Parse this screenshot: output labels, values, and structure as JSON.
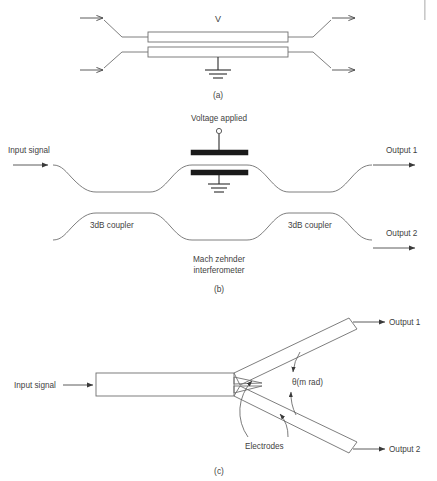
{
  "figure": {
    "background_color": "#ffffff",
    "line_color": "#6f6f6f",
    "electrode_color": "#1a1a1a",
    "text_color": "#3f3f3f"
  },
  "panel_a": {
    "caption": "(a)",
    "voltage_label": "V",
    "description": "Directional coupler modulator with two parallel waveguides",
    "icons": {
      "ground": "ground-icon",
      "input_arrow_top": "arrow-right-icon",
      "input_arrow_bottom": "arrow-right-icon",
      "output_arrow_top": "arrow-right-icon",
      "output_arrow_bottom": "arrow-right-icon"
    }
  },
  "panel_b": {
    "caption": "(b)",
    "voltage_label": "Voltage applied",
    "input_label": "Input signal",
    "output_1_label": "Output 1",
    "output_2_label": "Output 2",
    "coupler_left_label": "3dB coupler",
    "coupler_right_label": "3dB coupler",
    "interferometer_label_line1": "Mach zehnder",
    "interferometer_label_line2": "interferometer",
    "icons": {
      "terminal": "terminal-circle-icon",
      "ground": "ground-icon",
      "electrode_top": "electrode-bar-icon",
      "electrode_bottom": "electrode-bar-icon",
      "input_arrow": "arrow-right-icon",
      "output_1_arrow": "arrow-right-icon",
      "output_2_arrow": "arrow-right-icon"
    }
  },
  "panel_c": {
    "caption": "(c)",
    "input_label": "Input signal",
    "output_1_label": "Output 1",
    "output_2_label": "Output 2",
    "angle_label": "θ(m rad)",
    "electrodes_label": "Electrodes",
    "icons": {
      "input_arrow": "arrow-right-icon",
      "output_1_arrow": "arrow-right-icon",
      "output_2_arrow": "arrow-right-icon",
      "angle_arc": "double-arrow-arc-icon",
      "electrode_leader_top": "arrow-pointer-icon",
      "electrode_leader_bottom": "arrow-pointer-icon"
    }
  }
}
